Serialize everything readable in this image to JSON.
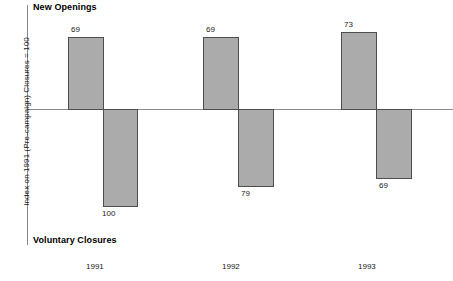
{
  "chart_data": {
    "type": "bar",
    "title": "",
    "xlabel": "",
    "ylabel": "Index on 1991 (Pre-campaign) Closures = 100",
    "categories": [
      "1991",
      "1992",
      "1993"
    ],
    "grid": false,
    "legend_position": "none",
    "ylim": [
      -100,
      100
    ],
    "axis_zero_label": "0",
    "series": [
      {
        "name": "New Openings",
        "direction": "positive",
        "values": [
          69,
          69,
          73
        ],
        "labels": [
          "69",
          "69",
          "73"
        ]
      },
      {
        "name": "Voluntary Closures",
        "direction": "negative",
        "values": [
          100,
          79,
          69
        ],
        "labels": [
          "100",
          "79",
          "69"
        ]
      }
    ],
    "annotations": {
      "top_caption": "New Openings",
      "bottom_caption": "Voluntary Closures"
    },
    "colors": {
      "bar_fill": "#ababab",
      "bar_stroke": "#4d4d4d",
      "axis": "#8a8a8a",
      "text": "#1a1a1a",
      "background": "#ffffff"
    }
  },
  "bars": [
    {
      "label": "69",
      "group": "1991",
      "series": "New Openings",
      "left": 68,
      "top": 37,
      "width": 36,
      "height": 73
    },
    {
      "label": "100",
      "group": "1991",
      "series": "Voluntary Closures",
      "left": 103,
      "top": 109,
      "width": 35,
      "height": 98
    },
    {
      "label": "69",
      "group": "1992",
      "series": "New Openings",
      "left": 203,
      "top": 37,
      "width": 36,
      "height": 73
    },
    {
      "label": "79",
      "group": "1992",
      "series": "Voluntary Closures",
      "left": 238,
      "top": 109,
      "width": 36,
      "height": 78
    },
    {
      "label": "73",
      "group": "1993",
      "series": "New Openings",
      "left": 341,
      "top": 32,
      "width": 36,
      "height": 78
    },
    {
      "label": "69",
      "group": "1993",
      "series": "Voluntary Closures",
      "left": 376,
      "top": 109,
      "width": 36,
      "height": 70
    }
  ],
  "value_labels": [
    {
      "text": "69",
      "left": 71,
      "top": 25
    },
    {
      "text": "100",
      "left": 102,
      "top": 209
    },
    {
      "text": "69",
      "left": 206,
      "top": 25
    },
    {
      "text": "79",
      "left": 241,
      "top": 189
    },
    {
      "text": "73",
      "left": 344,
      "top": 20
    },
    {
      "text": "69",
      "left": 379,
      "top": 181
    }
  ],
  "x_ticks": [
    {
      "text": "1991",
      "left": 86
    },
    {
      "text": "1992",
      "left": 222
    },
    {
      "text": "1993",
      "left": 358
    }
  ]
}
